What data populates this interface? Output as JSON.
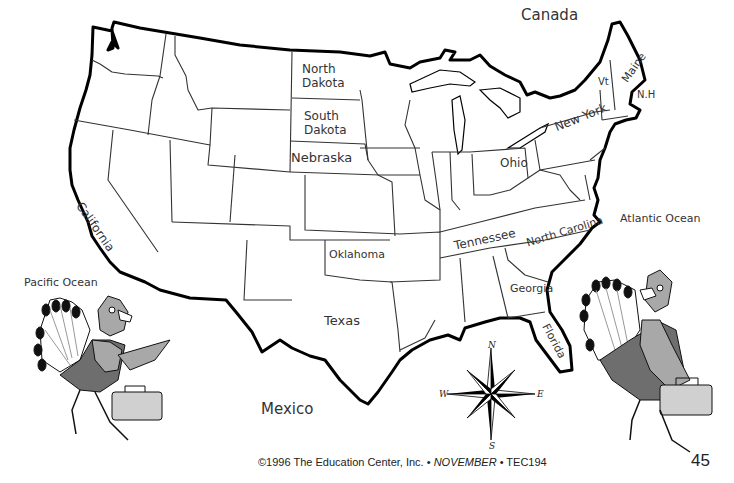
{
  "map": {
    "title": "United States outline map",
    "regions": {
      "canada": "Canada",
      "mexico": "Mexico",
      "pacific": "Pacific Ocean",
      "atlantic": "Atlantic Ocean"
    },
    "states": {
      "north_dakota_1": "North",
      "north_dakota_2": "Dakota",
      "south_dakota_1": "South",
      "south_dakota_2": "Dakota",
      "nebraska": "Nebraska",
      "california": "California",
      "oklahoma": "Oklahoma",
      "texas": "Texas",
      "ohio": "Ohio",
      "new_york": "New York",
      "vermont": "Vt",
      "maine": "Maine",
      "new_hampshire": "N.H",
      "tennessee": "Tennessee",
      "north_carolina": "North Carolina",
      "georgia": "Georgia",
      "florida": "Florida"
    },
    "compass": {
      "n": "N",
      "s": "S",
      "e": "E",
      "w": "W"
    },
    "colors": {
      "outline": "#000000",
      "border": "#333333",
      "turkey_dark": "#6e6e6e",
      "turkey_mid": "#a8a8a8",
      "turkey_light": "#d0d0d0"
    }
  },
  "footer": {
    "copyright": "©1996 The Education Center, Inc. • ",
    "month": "NOVEMBER",
    "code": " • TEC194",
    "page_number": "45"
  }
}
